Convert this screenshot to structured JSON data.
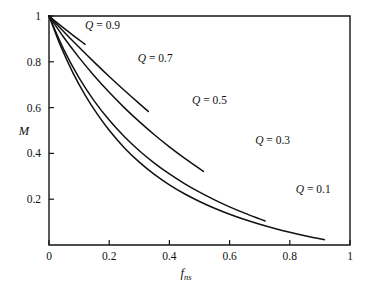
{
  "chart_data": {
    "type": "line",
    "title": "",
    "subtitle": "",
    "xlabel": "f_ns",
    "xlabel_base": "f",
    "xlabel_sub": "ns",
    "ylabel": "M",
    "xlim": [
      0,
      1
    ],
    "ylim": [
      0,
      1
    ],
    "xticks": [
      0,
      0.2,
      0.4,
      0.6,
      0.8,
      1
    ],
    "xtick_labels": [
      "0",
      "0.2",
      "0.4",
      "0.6",
      "0.8",
      "1"
    ],
    "yticks": [
      0.2,
      0.4,
      0.6,
      0.8,
      1
    ],
    "ytick_labels": [
      "0.2",
      "0.4",
      "0.6",
      "0.8",
      "1"
    ],
    "grid": false,
    "legend_position": "inline-annotations",
    "line_color": "#111111",
    "frame_color": "#151515",
    "series": [
      {
        "name": "Q = 0.9",
        "q": 0.9,
        "label_text": "Q = 0.9",
        "label_symbol": "Q",
        "label_rest": " = 0.9",
        "label_x": 0.12,
        "label_y": 0.945,
        "x": [
          0,
          0.02,
          0.04,
          0.06,
          0.08,
          0.1,
          0.12
        ],
        "values": [
          1,
          0.9782,
          0.9569,
          0.9361,
          0.9157,
          0.8958,
          0.8763
        ]
      },
      {
        "name": "Q = 0.7",
        "q": 0.7,
        "label_text": "Q = 0.7",
        "label_symbol": "Q",
        "label_rest": " = 0.7",
        "label_x": 0.295,
        "label_y": 0.8,
        "x": [
          0,
          0.05,
          0.1,
          0.15,
          0.2,
          0.25,
          0.3,
          0.33
        ],
        "values": [
          1,
          0.9304,
          0.8633,
          0.7986,
          0.7361,
          0.6757,
          0.6174,
          0.5834
        ]
      },
      {
        "name": "Q = 0.5",
        "q": 0.5,
        "label_text": "Q = 0.5",
        "label_symbol": "Q",
        "label_rest": " = 0.5",
        "label_x": 0.475,
        "label_y": 0.615,
        "x": [
          0,
          0.05,
          0.1,
          0.15,
          0.2,
          0.25,
          0.3,
          0.35,
          0.4,
          0.45,
          0.5,
          0.513
        ],
        "values": [
          1,
          0.9048,
          0.8182,
          0.7391,
          0.6667,
          0.6,
          0.5385,
          0.4815,
          0.4286,
          0.3793,
          0.3333,
          0.3216
        ]
      },
      {
        "name": "Q = 0.3",
        "q": 0.3,
        "label_text": "Q = 0.3",
        "label_symbol": "Q",
        "label_rest": " = 0.3",
        "label_x": 0.685,
        "label_y": 0.44,
        "x": [
          0,
          0.05,
          0.1,
          0.15,
          0.2,
          0.25,
          0.3,
          0.35,
          0.4,
          0.45,
          0.5,
          0.55,
          0.6,
          0.65,
          0.7,
          0.718
        ],
        "values": [
          1,
          0.8507,
          0.7297,
          0.6296,
          0.5455,
          0.4737,
          0.4118,
          0.3578,
          0.3103,
          0.2683,
          0.2308,
          0.1972,
          0.1667,
          0.1391,
          0.1139,
          0.1052
        ]
      },
      {
        "name": "Q = 0.1",
        "q": 0.1,
        "label_text": "Q = 0.1",
        "label_symbol": "Q",
        "label_rest": " = 0.1",
        "label_x": 0.82,
        "label_y": 0.225,
        "x": [
          0,
          0.04,
          0.08,
          0.12,
          0.16,
          0.2,
          0.25,
          0.3,
          0.35,
          0.4,
          0.45,
          0.5,
          0.55,
          0.6,
          0.65,
          0.7,
          0.75,
          0.8,
          0.85,
          0.9,
          0.915
        ],
        "values": [
          1,
          0.8643,
          0.7509,
          0.6549,
          0.5727,
          0.5015,
          0.4251,
          0.3617,
          0.3083,
          0.2629,
          0.2238,
          0.19,
          0.1604,
          0.1343,
          0.1113,
          0.0907,
          0.0723,
          0.0557,
          0.0407,
          0.0271,
          0.0232
        ]
      }
    ]
  },
  "axes": {
    "y_title": "M",
    "x_title_base": "f",
    "x_title_sub": "ns"
  }
}
